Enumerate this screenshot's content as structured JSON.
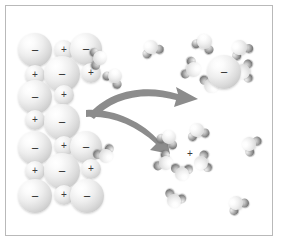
{
  "figure": {
    "background_color": "#ffffff",
    "border_color": "#b9b9b9",
    "frame": {
      "x": 5,
      "y": 5,
      "width": 268,
      "height": 231
    }
  },
  "symbols": {
    "negative": "−",
    "positive": "+"
  },
  "colors": {
    "arrow": "#8c8c8c",
    "arrow_dark": "#7a7a7a",
    "anion_sphere": "#e4e4e4",
    "cation_sphere": "#ededed",
    "water_oxygen": "#f0f0f0",
    "water_hydrogen": "#777777",
    "sign_text": "#3a3a3a"
  },
  "chart_data": {
    "type": "diagram",
    "groups": [
      {
        "name": "crystal-lattice",
        "label": "Ionic crystal lattice",
        "ion_count": 17
      },
      {
        "name": "hydrated-anion",
        "label": "Hydrated negative ion",
        "water_count": 4
      },
      {
        "name": "hydrated-cation",
        "label": "Hydrated positive ion",
        "water_count": 5
      },
      {
        "name": "free-water",
        "label": "Free water molecules",
        "count": 7
      },
      {
        "name": "arrows",
        "label": "Dissolution arrows",
        "count": 2
      }
    ]
  },
  "lattice": {
    "label": "Ionic crystal lattice",
    "ions": [
      {
        "name": "anion",
        "charge": "−",
        "x": 18,
        "y": 33,
        "r": 17
      },
      {
        "name": "cation",
        "charge": "+",
        "x": 54,
        "y": 40,
        "r": 10
      },
      {
        "name": "anion",
        "charge": "−",
        "x": 70,
        "y": 33,
        "r": 16
      },
      {
        "name": "cation",
        "charge": "+",
        "x": 25,
        "y": 65,
        "r": 10
      },
      {
        "name": "anion",
        "charge": "−",
        "x": 44,
        "y": 56,
        "r": 18
      },
      {
        "name": "cation",
        "charge": "+",
        "x": 81,
        "y": 63,
        "r": 10
      },
      {
        "name": "anion",
        "charge": "−",
        "x": 18,
        "y": 80,
        "r": 17
      },
      {
        "name": "cation",
        "charge": "+",
        "x": 54,
        "y": 85,
        "r": 10
      },
      {
        "name": "cation",
        "charge": "+",
        "x": 25,
        "y": 110,
        "r": 10
      },
      {
        "name": "anion",
        "charge": "−",
        "x": 44,
        "y": 104,
        "r": 18
      },
      {
        "name": "anion",
        "charge": "−",
        "x": 18,
        "y": 131,
        "r": 17
      },
      {
        "name": "cation",
        "charge": "+",
        "x": 54,
        "y": 136,
        "r": 10
      },
      {
        "name": "anion",
        "charge": "−",
        "x": 70,
        "y": 131,
        "r": 16
      },
      {
        "name": "cation",
        "charge": "+",
        "x": 25,
        "y": 161,
        "r": 10
      },
      {
        "name": "anion",
        "charge": "−",
        "x": 44,
        "y": 153,
        "r": 18
      },
      {
        "name": "cation",
        "charge": "+",
        "x": 81,
        "y": 159,
        "r": 10
      },
      {
        "name": "anion",
        "charge": "−",
        "x": 18,
        "y": 179,
        "r": 17
      },
      {
        "name": "cation",
        "charge": "+",
        "x": 54,
        "y": 185,
        "r": 10
      },
      {
        "name": "anion",
        "charge": "−",
        "x": 70,
        "y": 179,
        "r": 17
      }
    ]
  },
  "hydrated_anion": {
    "label": "Hydrated negative ion",
    "charge": "−",
    "center": {
      "x": 207,
      "y": 55,
      "r": 17
    },
    "waters": [
      {
        "x": 193,
        "y": 30,
        "angle": 20
      },
      {
        "x": 228,
        "y": 36,
        "angle": -35
      },
      {
        "x": 182,
        "y": 58,
        "angle": 110
      },
      {
        "x": 231,
        "y": 60,
        "angle": -95
      },
      {
        "x": 200,
        "y": 74,
        "angle": 175
      }
    ]
  },
  "hydrated_cation": {
    "label": "Hydrated positive ion",
    "charge": "+",
    "center": {
      "x": 179,
      "y": 143,
      "r": 11
    },
    "waters": [
      {
        "x": 158,
        "y": 126,
        "angle": 25
      },
      {
        "x": 186,
        "y": 119,
        "angle": -20
      },
      {
        "x": 155,
        "y": 152,
        "angle": 120
      },
      {
        "x": 190,
        "y": 152,
        "angle": -110
      },
      {
        "x": 171,
        "y": 163,
        "angle": 180
      }
    ]
  },
  "free_water": {
    "label": "Free water molecules",
    "molecules": [
      {
        "name": "water-molecule-top-left",
        "x": 104,
        "y": 65,
        "angle": 35
      },
      {
        "name": "water-molecule-top-center",
        "x": 140,
        "y": 36,
        "angle": -25
      },
      {
        "name": "water-molecule-edge-left",
        "x": 95,
        "y": 145,
        "angle": 150
      },
      {
        "name": "water-molecule-right-upper",
        "x": 238,
        "y": 133,
        "angle": -60
      },
      {
        "name": "water-molecule-bottom-mid",
        "x": 163,
        "y": 190,
        "angle": 200
      },
      {
        "name": "water-molecule-bottom-right",
        "x": 225,
        "y": 192,
        "angle": -40
      },
      {
        "name": "water-molecule-lattice-edge",
        "x": 89,
        "y": 47,
        "angle": 80
      }
    ]
  },
  "arrows": {
    "label": "Dissolution arrows",
    "items": [
      {
        "name": "arrow-to-hydrated-anion",
        "from": "crystal-lattice",
        "to": "hydrated-anion"
      },
      {
        "name": "arrow-to-hydrated-cation",
        "from": "crystal-lattice",
        "to": "hydrated-cation"
      }
    ]
  }
}
